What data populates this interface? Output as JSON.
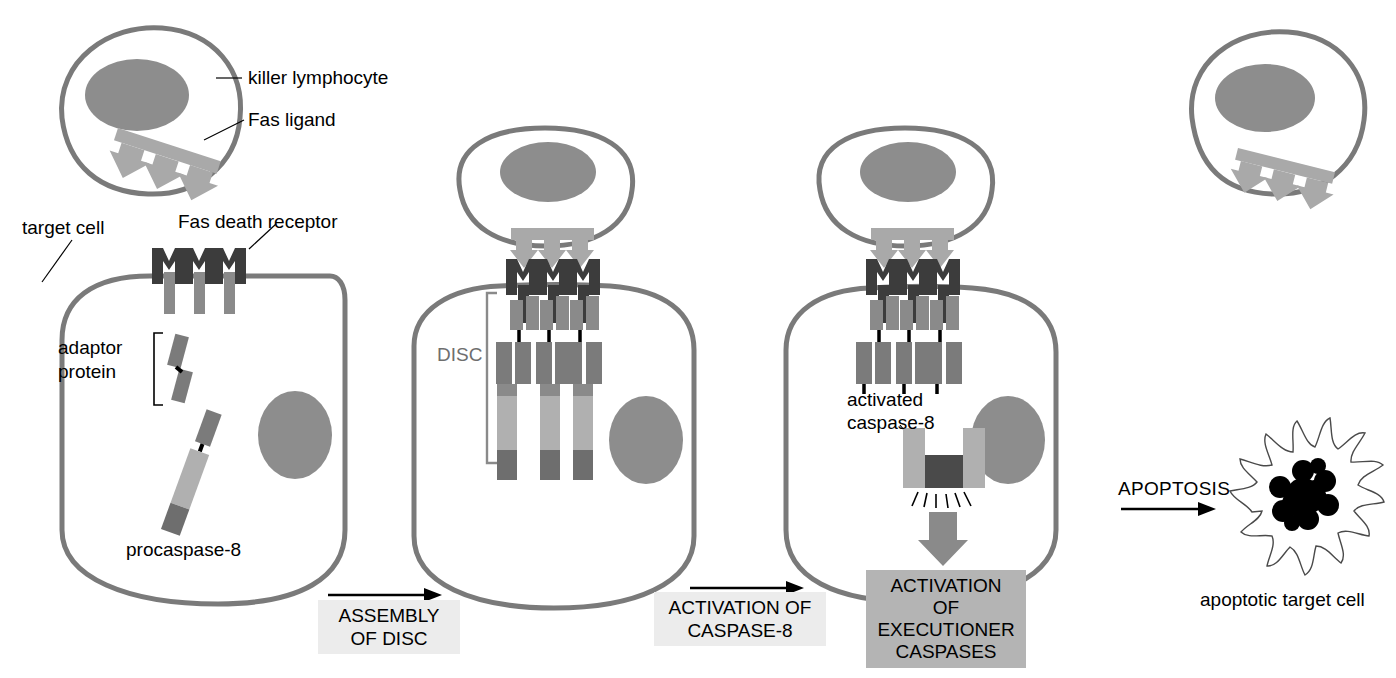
{
  "figure": {
    "type": "biological-pathway-diagram",
    "background": "#ffffff"
  },
  "colors": {
    "membrane": "#7a7a7a",
    "nucleus": "#8d8d8d",
    "fas_ligand": "#a9a9a9",
    "fas_receptor_dark": "#3c3c3c",
    "receptor_stem": "#8a8a8a",
    "adaptor_protein": "#7b7b7b",
    "procaspase_light": "#b0b0b0",
    "procaspase_dark": "#6e6e6e",
    "disc_bracket": "#8a8a8a",
    "activation_box": "#b4b4b4",
    "step_box": "#ececec",
    "apoptotic_nucleus": "#000000",
    "text": "#000000",
    "disc_text": "#6e6e6e"
  },
  "labels": {
    "killer_lymphocyte": "killer lymphocyte",
    "fas_ligand": "Fas ligand",
    "target_cell": "target cell",
    "fas_death_receptor": "Fas death receptor",
    "adaptor_protein": "adaptor\nprotein",
    "adaptor_protein_line1": "adaptor",
    "adaptor_protein_line2": "protein",
    "procaspase_8": "procaspase-8",
    "disc": "DISC",
    "activated_caspase_8_line1": "activated",
    "activated_caspase_8_line2": "caspase-8",
    "apoptotic_target_cell": "apoptotic target cell"
  },
  "boxes": {
    "activation_executioner": "ACTIVATION OF\nEXECUTIONER\nCASPASES",
    "activation_executioner_lines": [
      "ACTIVATION OF",
      "EXECUTIONER",
      "CASPASES"
    ]
  },
  "steps": [
    {
      "id": "assembly-of-disc",
      "label": "ASSEMBLY\nOF DISC",
      "lines": [
        "ASSEMBLY",
        "OF DISC"
      ]
    },
    {
      "id": "activation-of-caspase-8",
      "label": "ACTIVATION OF\nCASPASE-8",
      "lines": [
        "ACTIVATION OF",
        "CASPASE-8"
      ]
    }
  ],
  "apoptosis_arrow": {
    "label": "APOPTOSIS"
  },
  "panels": [
    {
      "id": "panel-1",
      "name": "resting-state",
      "components": [
        "killer lymphocyte",
        "Fas ligand",
        "target cell",
        "Fas death receptor",
        "adaptor protein",
        "procaspase-8",
        "nucleus"
      ]
    },
    {
      "id": "panel-2",
      "name": "disc-assembly",
      "components": [
        "killer lymphocyte",
        "Fas ligand",
        "target cell",
        "Fas death receptor",
        "DISC",
        "adaptor protein",
        "procaspase-8",
        "nucleus"
      ]
    },
    {
      "id": "panel-3",
      "name": "caspase-8-activation",
      "components": [
        "killer lymphocyte",
        "Fas ligand",
        "target cell",
        "Fas death receptor",
        "adaptor protein",
        "activated caspase-8",
        "ACTIVATION OF EXECUTIONER CASPASES",
        "nucleus"
      ]
    },
    {
      "id": "panel-4",
      "name": "apoptotic-outcome",
      "components": [
        "killer lymphocyte",
        "Fas ligand",
        "apoptotic target cell"
      ]
    }
  ]
}
